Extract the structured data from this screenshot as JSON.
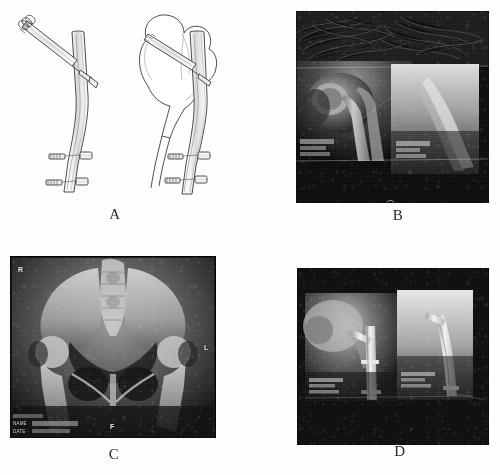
{
  "figure": {
    "kind": "medical-radiograph-figure",
    "panel_count": 4,
    "background_color": "#fdfdfc"
  },
  "panels": [
    {
      "id": "A",
      "label": "A",
      "type": "line-drawing",
      "description": "Schematic line drawing of a proximal femoral intramedullary nail: left view shows the implant alone, right view shows the implant seated within the femur outline.",
      "views": [
        {
          "name": "implant-only",
          "components": [
            "intramedullary-nail",
            "cephalomedullary-lag-screw",
            "distal-locking-screw-proximal",
            "distal-locking-screw-distal"
          ]
        },
        {
          "name": "implant-in-femur",
          "components": [
            "femur-outline",
            "femoral-head",
            "femoral-neck",
            "greater-trochanter",
            "intramedullary-nail",
            "cephalomedullary-lag-screw",
            "distal-locking-screw-proximal",
            "distal-locking-screw-distal"
          ]
        }
      ],
      "line_color": "#3a3a3a"
    },
    {
      "id": "B",
      "label": "B",
      "type": "radiograph",
      "description": "Pre-operative hip radiographs: anteroposterior view (left) and lateral view (right) of the proximal femur showing the fracture.",
      "sub_images": [
        {
          "name": "ap-view",
          "overlay_text": ""
        },
        {
          "name": "lateral-view",
          "overlay_text": ""
        }
      ]
    },
    {
      "id": "C",
      "label": "C",
      "type": "radiograph",
      "description": "Anteroposterior pelvis radiograph showing both hips.",
      "markers": [
        {
          "name": "right-marker",
          "text": "R"
        },
        {
          "name": "left-marker",
          "text": "L"
        },
        {
          "name": "bottom-marker",
          "text": "F"
        }
      ],
      "overlay": {
        "name_label": "NAME",
        "date_label": "DATE"
      }
    },
    {
      "id": "D",
      "label": "D",
      "type": "radiograph",
      "description": "Post-operative hip radiographs: anteroposterior view (left) and lateral view (right) showing the intramedullary nail and lag screw in position.",
      "sub_images": [
        {
          "name": "ap-view",
          "overlay_text": ""
        },
        {
          "name": "lateral-view",
          "overlay_text": ""
        }
      ]
    }
  ]
}
